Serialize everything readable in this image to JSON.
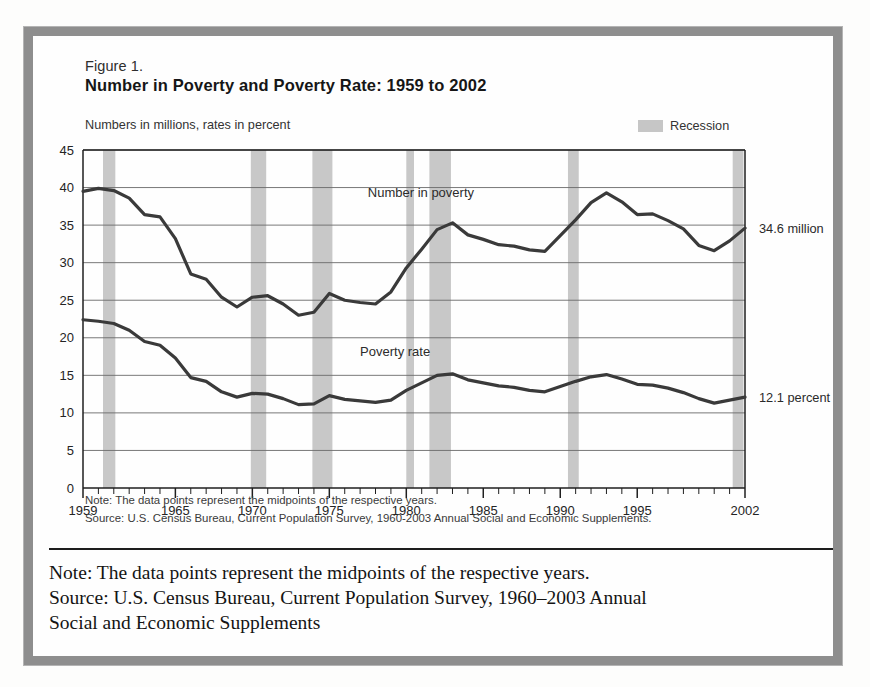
{
  "figure": {
    "label": "Figure 1.",
    "title": "Number in Poverty and Poverty Rate:  1959 to 2002",
    "axis_note": "Numbers in millions, rates in percent",
    "legend": {
      "swatch_name": "recession-swatch",
      "label": "Recession",
      "color": "#c6c6c6"
    },
    "note_line": "Note:  The data points represent the midpoints of the respective years.",
    "source_line": "Source:  U.S. Census Bureau, Current Population Survey, 1960-2003 Annual Social and Economic Supplements."
  },
  "caption": {
    "line1": "Note: The data points represent the midpoints of the respective years.",
    "line2": "Source: U.S. Census Bureau, Current Population Survey, 1960–2003 Annual",
    "line3": "Social and Economic Supplements"
  },
  "colors": {
    "line": "#3a3a3a",
    "recession_band": "#c8c8c8",
    "gridline": "#6a6a6a",
    "axis": "#1f1f1f",
    "frame": "#8e8e8e",
    "text": "#242424"
  },
  "chart_data": {
    "type": "line",
    "title": "Number in Poverty and Poverty Rate:  1959 to 2002",
    "subtitle": "Numbers in millions, rates in percent",
    "xlabel": "",
    "ylabel": "",
    "xlim": [
      1959,
      2002
    ],
    "ylim": [
      0,
      45
    ],
    "yticks": [
      0,
      5,
      10,
      15,
      20,
      25,
      30,
      35,
      40,
      45
    ],
    "xticks_labeled": [
      1959,
      1965,
      1970,
      1975,
      1980,
      1985,
      1990,
      1995,
      2002
    ],
    "xtick_step_minor": 1,
    "grid": true,
    "legend_position": "top-right",
    "x": [
      1959,
      1960,
      1961,
      1962,
      1963,
      1964,
      1965,
      1966,
      1967,
      1968,
      1969,
      1970,
      1971,
      1972,
      1973,
      1974,
      1975,
      1976,
      1977,
      1978,
      1979,
      1980,
      1981,
      1982,
      1983,
      1984,
      1985,
      1986,
      1987,
      1988,
      1989,
      1990,
      1991,
      1992,
      1993,
      1994,
      1995,
      1996,
      1997,
      1998,
      1999,
      2000,
      2001,
      2002
    ],
    "series": [
      {
        "name": "Number in poverty",
        "label": "Number in poverty",
        "units": "millions",
        "end_label": "34.6 million",
        "end_value": 34.6,
        "values": [
          39.5,
          39.9,
          39.6,
          38.6,
          36.4,
          36.1,
          33.2,
          28.5,
          27.8,
          25.4,
          24.1,
          25.4,
          25.6,
          24.5,
          23.0,
          23.4,
          25.9,
          25.0,
          24.7,
          24.5,
          26.1,
          29.3,
          31.8,
          34.4,
          35.3,
          33.7,
          33.1,
          32.4,
          32.2,
          31.7,
          31.5,
          33.6,
          35.7,
          38.0,
          39.3,
          38.1,
          36.4,
          36.5,
          35.6,
          34.5,
          32.3,
          31.6,
          32.9,
          34.6
        ]
      },
      {
        "name": "Poverty rate",
        "label": "Poverty rate",
        "units": "percent",
        "end_label": "12.1 percent",
        "end_value": 12.1,
        "values": [
          22.4,
          22.2,
          21.9,
          21.0,
          19.5,
          19.0,
          17.3,
          14.7,
          14.2,
          12.8,
          12.1,
          12.6,
          12.5,
          11.9,
          11.1,
          11.2,
          12.3,
          11.8,
          11.6,
          11.4,
          11.7,
          13.0,
          14.0,
          15.0,
          15.2,
          14.4,
          14.0,
          13.6,
          13.4,
          13.0,
          12.8,
          13.5,
          14.2,
          14.8,
          15.1,
          14.5,
          13.8,
          13.7,
          13.3,
          12.7,
          11.9,
          11.3,
          11.7,
          12.1
        ]
      }
    ],
    "recessions": [
      {
        "start": 1960.3,
        "end": 1961.1
      },
      {
        "start": 1969.9,
        "end": 1970.9
      },
      {
        "start": 1973.9,
        "end": 1975.2
      },
      {
        "start": 1980.0,
        "end": 1980.5
      },
      {
        "start": 1981.5,
        "end": 1982.9
      },
      {
        "start": 1990.5,
        "end": 1991.2
      },
      {
        "start": 2001.2,
        "end": 2001.9
      }
    ]
  }
}
